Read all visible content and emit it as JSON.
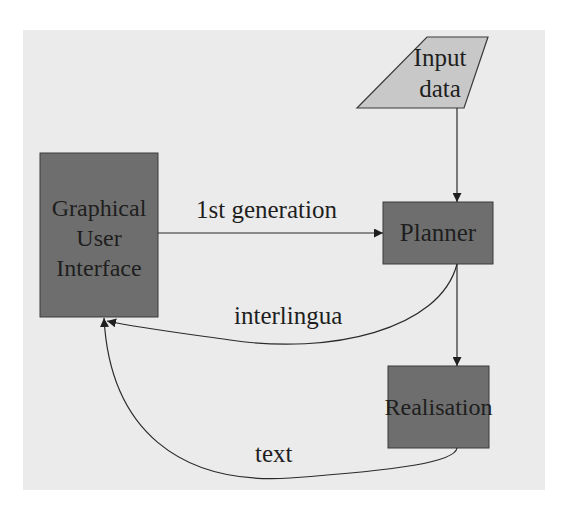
{
  "diagram": {
    "type": "flowchart",
    "colors": {
      "background_panel": "#ebebeb",
      "box_fill": "#6e6e6e",
      "input_fill": "#c8c8c8",
      "stroke": "#2a2a2a",
      "text": "#1e1e1e"
    },
    "nodes": {
      "input": {
        "label_line1": "Input",
        "label_line2": "data",
        "shape": "parallelogram"
      },
      "gui": {
        "label_line1": "Graphical",
        "label_line2": "User",
        "label_line3": "Interface",
        "shape": "rectangle"
      },
      "planner": {
        "label": "Planner",
        "shape": "rectangle"
      },
      "realisation": {
        "label": "Realisation",
        "shape": "rectangle"
      }
    },
    "edges": {
      "input_to_planner": {
        "from": "Input data",
        "to": "Planner",
        "label": ""
      },
      "gui_to_planner": {
        "from": "Graphical User Interface",
        "to": "Planner",
        "label": "1st generation"
      },
      "planner_to_gui": {
        "from": "Planner",
        "to": "Graphical User Interface",
        "label": "interlingua"
      },
      "planner_to_realisation": {
        "from": "Planner",
        "to": "Realisation",
        "label": ""
      },
      "realisation_to_gui": {
        "from": "Realisation",
        "to": "Graphical User Interface",
        "label": "text"
      }
    }
  }
}
